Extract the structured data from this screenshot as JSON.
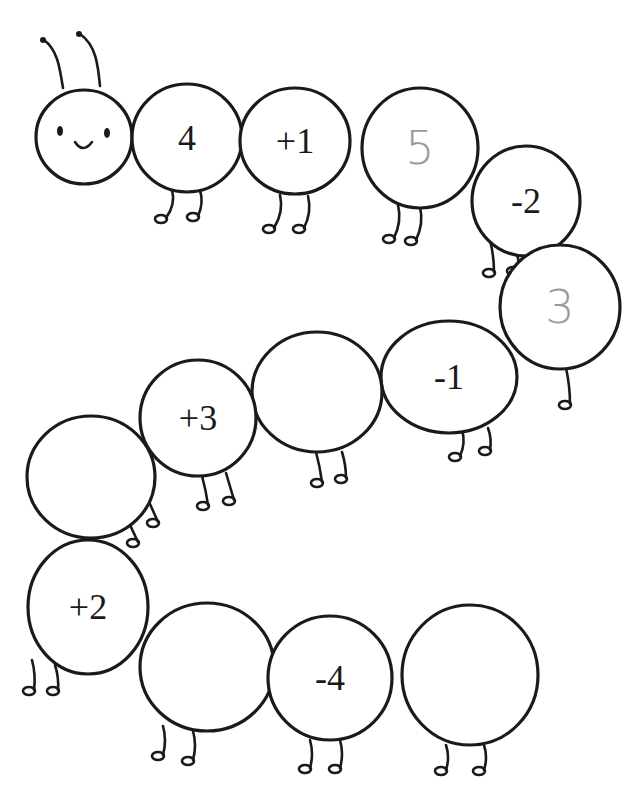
{
  "worksheet": {
    "title": "Caterpillar number line",
    "head": {
      "face": "smiley",
      "antennae": 2
    },
    "segments": [
      {
        "label": "4",
        "style": "printed"
      },
      {
        "label": "+1",
        "style": "printed"
      },
      {
        "label": "5",
        "style": "handwritten"
      },
      {
        "label": "-2",
        "style": "printed"
      },
      {
        "label": "3",
        "style": "handwritten"
      },
      {
        "label": "-1",
        "style": "printed"
      },
      {
        "label": "",
        "style": "blank"
      },
      {
        "label": "+3",
        "style": "printed"
      },
      {
        "label": "",
        "style": "blank"
      },
      {
        "label": "+2",
        "style": "printed"
      },
      {
        "label": "",
        "style": "blank"
      },
      {
        "label": "-4",
        "style": "printed"
      },
      {
        "label": "",
        "style": "blank"
      }
    ],
    "colors": {
      "ink": "#1a1a1a",
      "pencil": "#9a9a9a",
      "paper": "#ffffff"
    }
  }
}
